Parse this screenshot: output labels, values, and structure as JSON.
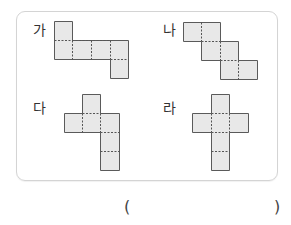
{
  "options": [
    {
      "id": "ga",
      "label": "가"
    },
    {
      "id": "na",
      "label": "나"
    },
    {
      "id": "da",
      "label": "다"
    },
    {
      "id": "ra",
      "label": "라"
    }
  ],
  "answer": {
    "open_paren": "(",
    "close_paren": ")",
    "value": ""
  },
  "colors": {
    "fill": "#e8e8e8",
    "stroke": "#5a5a5a",
    "fold": "#555555",
    "card_border": "#d4d4d4"
  }
}
